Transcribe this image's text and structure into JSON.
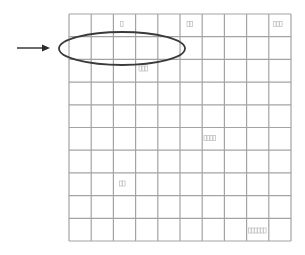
{
  "diagram": {
    "title": "",
    "grid": {
      "rows": 10,
      "cols": 10,
      "x0": 69,
      "y0": 14,
      "x1": 291,
      "y1": 241,
      "line_color": "#a3a3a3"
    },
    "ellipse": {
      "cx": 122,
      "cy": 48.5,
      "rx": 63,
      "ry": 16.5,
      "stroke": "#3a3a3a",
      "stroke_width": 1.8,
      "description": "Ellipse highlighting the second row, columns 1-5"
    },
    "arrow": {
      "x1": 17,
      "y1": 48,
      "x2": 50,
      "y2": 48,
      "color": "#2a2a2a",
      "description": "Arrow pointing right at the highlighted ellipse"
    },
    "cell_labels": [
      {
        "row": 0,
        "col": 2,
        "text": "□",
        "chars": 1,
        "x": 120.5,
        "y": 21.5
      },
      {
        "row": 0,
        "col": 5,
        "text": "□□",
        "chars": 2,
        "x": 187,
        "y": 21.5
      },
      {
        "row": 0,
        "col": 9,
        "text": "□□□",
        "chars": 3,
        "x": 273.5,
        "y": 21.5
      },
      {
        "row": 2,
        "col": 3,
        "text": "□□□",
        "chars": 3,
        "x": 139,
        "y": 66
      },
      {
        "row": 5,
        "col": 6,
        "text": "□□□□",
        "chars": 4,
        "x": 204,
        "y": 135.5
      },
      {
        "row": 7,
        "col": 2,
        "text": "□□",
        "chars": 2,
        "x": 119.5,
        "y": 181
      },
      {
        "row": 9,
        "col": 8,
        "text": "□□□□□□",
        "chars": 6,
        "x": 248.5,
        "y": 228
      }
    ],
    "label_color": "#c4c4c4"
  }
}
